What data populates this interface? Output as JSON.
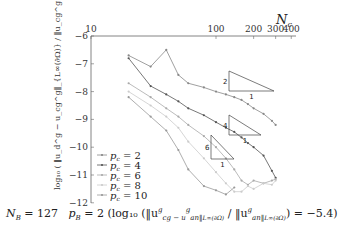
{
  "chart_data": {
    "type": "line",
    "title": "",
    "xlabel": "N_c",
    "ylabel": "log10(||u_d^g - u_cg^g||_{L∞(∂Ω)} / ||u_cg^g||_{L∞(∂Ω)})",
    "xscale": "log",
    "xlim": [
      10,
      400
    ],
    "ylim": [
      -12,
      -6
    ],
    "x_ticks": [
      "10",
      "100",
      "200",
      "300",
      "400"
    ],
    "y_ticks": [
      "-6",
      "-7",
      "-8",
      "-9",
      "-10",
      "-11",
      "-12"
    ],
    "x_axis_position": "top",
    "grid": false,
    "legend_position": "lower left",
    "series": [
      {
        "name": "p_c = 2",
        "color": "#888888",
        "x": [
          20,
          30,
          40,
          50,
          60,
          80,
          100,
          120,
          140,
          160,
          180,
          200,
          240,
          280,
          300
        ],
        "y": [
          -6.7,
          -7.1,
          -6.5,
          -7.4,
          -7.7,
          -7.85,
          -8.0,
          -8.1,
          -8.2,
          -8.3,
          -8.45,
          -8.6,
          -8.8,
          -9.05,
          -9.2
        ]
      },
      {
        "name": "p_c = 4",
        "color": "#555555",
        "x": [
          20,
          30,
          40,
          50,
          60,
          80,
          100,
          120,
          140,
          160,
          180,
          200,
          240,
          280,
          300
        ],
        "y": [
          -6.8,
          -7.8,
          -8.1,
          -8.35,
          -8.6,
          -8.85,
          -9.1,
          -9.3,
          -9.45,
          -9.65,
          -9.85,
          -10.0,
          -10.3,
          -10.85,
          -11.1
        ]
      },
      {
        "name": "p_c = 6",
        "color": "#aaaaaa",
        "x": [
          20,
          30,
          40,
          50,
          60,
          80,
          100,
          120,
          140,
          160,
          180,
          200,
          240,
          280,
          300
        ],
        "y": [
          -7.7,
          -8.2,
          -8.6,
          -8.9,
          -9.2,
          -9.6,
          -10.0,
          -10.4,
          -10.8,
          -11.2,
          -11.35,
          -11.2,
          -11.3,
          -11.2,
          -11.15
        ]
      },
      {
        "name": "p_c = 8",
        "color": "#cccccc",
        "x": [
          20,
          30,
          40,
          50,
          60,
          80,
          100,
          120,
          140,
          160,
          180,
          200,
          240,
          280,
          300
        ],
        "y": [
          -8.0,
          -8.5,
          -8.9,
          -9.3,
          -9.8,
          -10.4,
          -10.9,
          -11.3,
          -11.6,
          -11.6,
          -11.4,
          -11.5,
          -11.3,
          -11.35,
          -11.2
        ]
      },
      {
        "name": "p_c = 10",
        "color": "#999999",
        "x": [
          20,
          30,
          40,
          50,
          60,
          80,
          100,
          120,
          140
        ],
        "y": [
          -8.2,
          -8.9,
          -9.4,
          -10.1,
          -10.8,
          -11.4,
          -11.55,
          -11.7,
          -11.45
        ]
      }
    ],
    "annotations": [
      {
        "type": "slope-triangle",
        "rise": "2",
        "run": "1"
      },
      {
        "type": "slope-triangle",
        "rise": "4",
        "run": "1"
      },
      {
        "type": "slope-triangle",
        "rise": "6",
        "run": "1"
      }
    ],
    "caption": "N_B = 127   p_B = 2 (log10(||u_cg^g − u_an^g||_{L∞(∂Ω)} / ||u_an^g||_{L∞(∂Ω)}) = −5.4)"
  },
  "labels": {
    "nc": "N",
    "nc_sub": "c",
    "x_ticks": [
      "10",
      "100",
      "200",
      "300",
      "400"
    ],
    "y_ticks": [
      "−6",
      "−7",
      "−8",
      "−9",
      "−10",
      "−11",
      "−12"
    ],
    "legend": [
      "p",
      "p",
      "p",
      "p",
      "p"
    ],
    "legend_vals": [
      "= 2",
      "= 4",
      "= 6",
      "= 8",
      "= 10"
    ],
    "slope_rise": [
      "2",
      "4",
      "6"
    ],
    "slope_run": [
      "1",
      "1",
      "1"
    ],
    "ylabel": "log₁₀ ( ‖u_d^g − u_cg^g‖_{L∞(∂Ω)} / ‖u_cg^g‖_{L∞(∂Ω)} )",
    "caption_nb": "N",
    "caption_nb_val": " = 127",
    "caption_pb": "p",
    "caption_pb_val": " = 2 (log₁₀ (‖u",
    "caption_rest": "cg − u",
    "caption_rest2": "an‖",
    "caption_final": " / ‖u",
    "caption_end": "an‖",
    "caption_tail": ") = −5.4)"
  }
}
